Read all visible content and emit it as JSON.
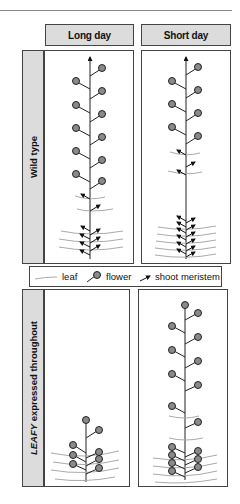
{
  "columns": [
    {
      "label": "Long day"
    },
    {
      "label": "Short day"
    }
  ],
  "rows": [
    {
      "label": "Wild type"
    },
    {
      "label_italic": "LEAFY",
      "label_rest": " expressed throughout"
    }
  ],
  "legend": {
    "items": [
      {
        "icon": "leaf-icon",
        "label": "leaf"
      },
      {
        "icon": "flower-icon",
        "label": "flower"
      },
      {
        "icon": "shoot-meristem-icon",
        "label": "shoot meristem"
      }
    ]
  },
  "colors": {
    "header_fill": "#dcdcdc",
    "flower_fill": "#8a8a8a",
    "leaf_stroke": "#aaaaaa",
    "border": "#444444"
  },
  "panels": {
    "wild_type_long_day": {
      "flowers": 11,
      "shoot_meristems": 9,
      "leaves": 5
    },
    "wild_type_short_day": {
      "flowers": 9,
      "shoot_meristems": 17,
      "leaves": 9
    },
    "leafy_long_day": {
      "flowers": 8,
      "leaves": 4
    },
    "leafy_short_day": {
      "flowers": 17,
      "leaves": 6
    }
  }
}
